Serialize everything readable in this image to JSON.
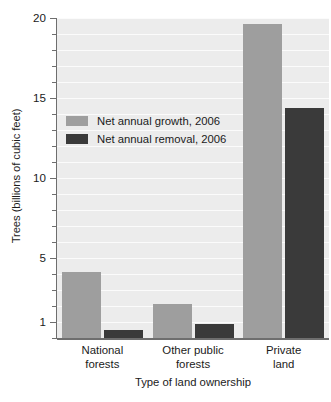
{
  "chart_data": {
    "type": "bar",
    "title": "",
    "xlabel": "Type of land ownership",
    "ylabel": "Trees (billions of cubic feet)",
    "categories": [
      "National forests",
      "Other public forests",
      "Private land"
    ],
    "category_lines": [
      [
        "National",
        "forests"
      ],
      [
        "Other public",
        "forests"
      ],
      [
        "Private",
        "land"
      ]
    ],
    "series": [
      {
        "name": "Net annual growth, 2006",
        "color": "#9e9e9e",
        "values": [
          4.1,
          2.1,
          19.6
        ]
      },
      {
        "name": "Net annual removal, 2006",
        "color": "#3a3a3a",
        "values": [
          0.5,
          0.9,
          14.4
        ]
      }
    ],
    "ylim": [
      0,
      20
    ],
    "ytick_labels": [
      "20",
      "15",
      "10",
      "5",
      "1"
    ],
    "ytick_values": [
      20,
      15,
      10,
      5,
      1
    ],
    "yminor_step": 1,
    "grid": true,
    "grid_color": "#fbfbfb",
    "legend_position": "inside-upper-left",
    "plot_background": "#ececec",
    "axis_color": "#6e6e6e"
  },
  "legend": {
    "items": [
      {
        "label": "Net annual growth, 2006"
      },
      {
        "label": "Net annual removal, 2006"
      }
    ]
  },
  "axes": {
    "y_title": "Trees (billions of cubic feet)",
    "x_title": "Type of land ownership"
  }
}
